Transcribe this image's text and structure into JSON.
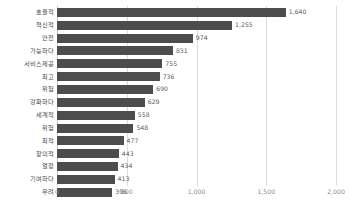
{
  "chart_data": {
    "type": "bar",
    "orientation": "horizontal",
    "title": "",
    "subtitle": "",
    "xlabel": "",
    "ylabel": "",
    "xlim": [
      0,
      2000
    ],
    "xticks": [
      "0",
      "500",
      "1,000",
      "1,500",
      "2,000"
    ],
    "xtick_values": [
      0,
      500,
      1000,
      1500,
      2000
    ],
    "grid": "vertical",
    "legend": "none",
    "bar_color": "#4d4d4d",
    "gridline_color": "#dddddd",
    "label_color": "#4a4a4a",
    "tick_color": "#8a8a8a",
    "background": "#ffffff",
    "categories": [
      "효율적",
      "혁신적",
      "안전",
      "가능하다",
      "서비스제공",
      "최고",
      "위험",
      "강화하다",
      "세계적",
      "위험",
      "최적",
      "창의적",
      "열정",
      "기여하다",
      "우려"
    ],
    "values": [
      1640,
      1255,
      974,
      831,
      755,
      736,
      690,
      629,
      558,
      548,
      477,
      443,
      434,
      413,
      396
    ],
    "value_labels": [
      "1,640",
      "1,255",
      "974",
      "831",
      "755",
      "736",
      "690",
      "629",
      "558",
      "548",
      "477",
      "443",
      "434",
      "413",
      "396"
    ]
  }
}
